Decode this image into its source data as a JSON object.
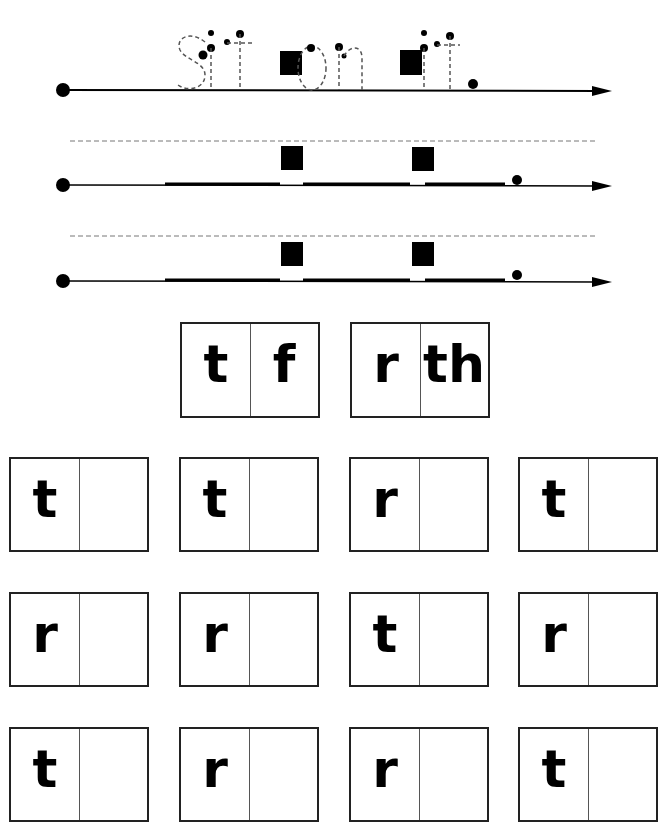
{
  "worksheet": {
    "trace_sentence": {
      "words": [
        "sit",
        "on",
        "it"
      ],
      "punctuation": ".",
      "text": "sit on it."
    },
    "writing_lines": 3,
    "word_families": [
      {
        "onset": "t",
        "rime": "f"
      },
      {
        "onset": "r",
        "rime": "th"
      }
    ],
    "practice_rows": [
      [
        "t",
        "t",
        "r",
        "t"
      ],
      [
        "r",
        "r",
        "t",
        "r"
      ],
      [
        "t",
        "r",
        "r",
        "t"
      ]
    ],
    "colors": {
      "ink": "#000000",
      "dashed_guide": "#777777",
      "paper": "#ffffff"
    }
  }
}
